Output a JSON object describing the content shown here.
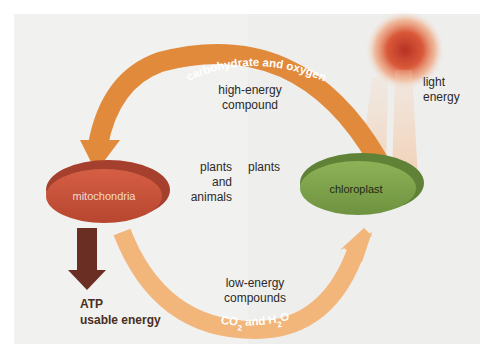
{
  "diagram": {
    "top_arrow_label": "carbohydrate and oxygen",
    "bottom_arrow_label_parts": [
      "CO",
      "2",
      " and H",
      "2",
      "O"
    ],
    "bottom_arrow_label": "CO2 and H2O",
    "high_energy": [
      "high-energy",
      "compound"
    ],
    "low_energy": [
      "low-energy",
      "compounds"
    ],
    "left_organism": [
      "plants",
      "and",
      "animals"
    ],
    "right_organism": "plants",
    "light_energy": [
      "light",
      "energy"
    ],
    "mitochondria": "mitochondria",
    "chloroplast": "chloroplast",
    "atp_title": "ATP",
    "atp_subtitle": "usable energy"
  },
  "colors": {
    "background_left": "#f1f1ef",
    "background_right": "#eeeeec",
    "top_arc": "#e28a3c",
    "bottom_arc": "#f2b57a",
    "mitochondria": "#c9543e",
    "mitochondria_rim": "#a6402e",
    "chloroplast": "#7fa24a",
    "chloroplast_rim": "#5f8236",
    "atp_arrow": "#6b2e22",
    "sun_core": "#c0392b",
    "sun_glow": "#f0a070"
  }
}
